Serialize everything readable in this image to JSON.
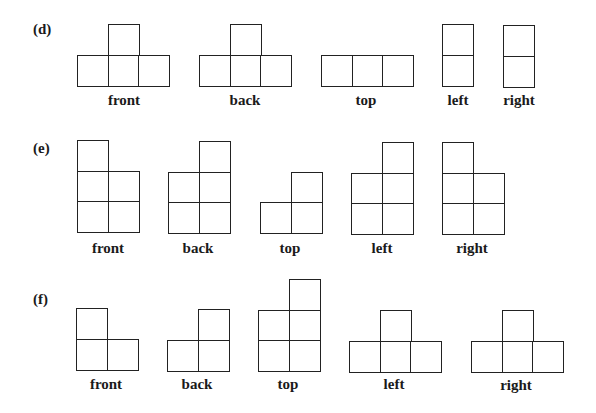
{
  "diagram": {
    "cell_size": 31,
    "line_color": "#222222",
    "parts": [
      {
        "id": "d",
        "label": "(d)",
        "label_pos": [
          33,
          21
        ],
        "views": [
          {
            "name": "front",
            "origin": [
              77,
              24
            ],
            "label_x": 124,
            "label_y": 92,
            "cells": [
              [
                1,
                0
              ],
              [
                0,
                1
              ],
              [
                1,
                1
              ],
              [
                2,
                1
              ]
            ]
          },
          {
            "name": "back",
            "origin": [
              199,
              24
            ],
            "label_x": 245,
            "label_y": 92,
            "cells": [
              [
                1,
                0
              ],
              [
                0,
                1
              ],
              [
                1,
                1
              ],
              [
                2,
                1
              ]
            ]
          },
          {
            "name": "top",
            "origin": [
              321,
              24
            ],
            "label_x": 366,
            "label_y": 92,
            "cells": [
              [
                0,
                1
              ],
              [
                1,
                1
              ],
              [
                2,
                1
              ]
            ]
          },
          {
            "name": "left",
            "origin": [
              442,
              24
            ],
            "label_x": 458,
            "label_y": 92,
            "cells": [
              [
                0,
                0
              ],
              [
                0,
                1
              ]
            ]
          },
          {
            "name": "right",
            "origin": [
              503,
              25
            ],
            "label_x": 519,
            "label_y": 92,
            "cells": [
              [
                0,
                0
              ],
              [
                0,
                1
              ]
            ]
          }
        ]
      },
      {
        "id": "e",
        "label": "(e)",
        "label_pos": [
          33,
          140
        ],
        "views": [
          {
            "name": "front",
            "origin": [
              77,
              140
            ],
            "label_x": 108,
            "label_y": 240,
            "cells": [
              [
                0,
                0
              ],
              [
                0,
                1
              ],
              [
                1,
                1
              ],
              [
                0,
                2
              ],
              [
                1,
                2
              ]
            ]
          },
          {
            "name": "back",
            "origin": [
              168,
              141
            ],
            "label_x": 198,
            "label_y": 240,
            "cells": [
              [
                1,
                0
              ],
              [
                0,
                1
              ],
              [
                1,
                1
              ],
              [
                0,
                2
              ],
              [
                1,
                2
              ]
            ]
          },
          {
            "name": "top",
            "origin": [
              260,
              141
            ],
            "label_x": 290,
            "label_y": 240,
            "cells": [
              [
                1,
                1
              ],
              [
                0,
                2
              ],
              [
                1,
                2
              ]
            ]
          },
          {
            "name": "left",
            "origin": [
              351,
              142
            ],
            "label_x": 382,
            "label_y": 240,
            "cells": [
              [
                1,
                0
              ],
              [
                0,
                1
              ],
              [
                1,
                1
              ],
              [
                0,
                2
              ],
              [
                1,
                2
              ]
            ]
          },
          {
            "name": "right",
            "origin": [
              442,
              142
            ],
            "label_x": 472,
            "label_y": 240,
            "cells": [
              [
                0,
                0
              ],
              [
                0,
                1
              ],
              [
                1,
                1
              ],
              [
                0,
                2
              ],
              [
                1,
                2
              ]
            ]
          }
        ]
      },
      {
        "id": "f",
        "label": "(f)",
        "label_pos": [
          33,
          291
        ],
        "views": [
          {
            "name": "front",
            "origin": [
              76,
              308
            ],
            "label_x": 106,
            "label_y": 376,
            "cells": [
              [
                0,
                0
              ],
              [
                0,
                1
              ],
              [
                1,
                1
              ]
            ]
          },
          {
            "name": "back",
            "origin": [
              167,
              309
            ],
            "label_x": 197,
            "label_y": 376,
            "cells": [
              [
                1,
                0
              ],
              [
                0,
                1
              ],
              [
                1,
                1
              ]
            ]
          },
          {
            "name": "top",
            "origin": [
              258,
              279
            ],
            "label_x": 288,
            "label_y": 376,
            "cells": [
              [
                1,
                0
              ],
              [
                0,
                1
              ],
              [
                1,
                1
              ],
              [
                0,
                2
              ],
              [
                1,
                2
              ]
            ]
          },
          {
            "name": "left",
            "origin": [
              349,
              310
            ],
            "label_x": 394,
            "label_y": 376,
            "cells": [
              [
                1,
                0
              ],
              [
                0,
                1
              ],
              [
                1,
                1
              ],
              [
                2,
                1
              ]
            ]
          },
          {
            "name": "right",
            "origin": [
              471,
              310
            ],
            "label_x": 516,
            "label_y": 377,
            "cells": [
              [
                1,
                0
              ],
              [
                0,
                1
              ],
              [
                1,
                1
              ],
              [
                2,
                1
              ]
            ]
          }
        ]
      }
    ]
  }
}
